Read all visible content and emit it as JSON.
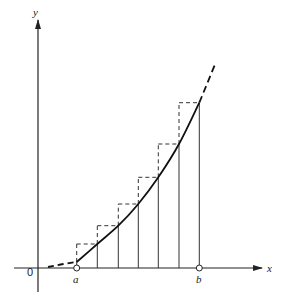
{
  "diagram": {
    "title": "",
    "labels": {
      "y_axis": "y",
      "x_axis": "x",
      "origin": "0",
      "a": "a",
      "b": "b"
    },
    "colors": {
      "ink": "#222222",
      "background": "#ffffff"
    },
    "axes": {
      "origin_px": [
        38,
        268
      ],
      "y_axis_top_px": 20,
      "x_axis_right_px": 262
    },
    "partition_x_px": [
      76.7,
      97.3,
      118.3,
      138.3,
      158.3,
      179,
      199.3
    ],
    "rectangle_top_y_px": [
      244,
      225.7,
      204,
      177.3,
      144,
      102.7
    ],
    "rectangle_count": 6,
    "rectangle_style": "dashed tops and left sides (upper sum), solid verticals at partition points",
    "curve": {
      "solid_from": "a",
      "solid_to": "b",
      "dashed_extensions": "before a and after b"
    },
    "endpoint_markers": [
      "open-circle-at-a",
      "open-circle-at-b"
    ]
  }
}
